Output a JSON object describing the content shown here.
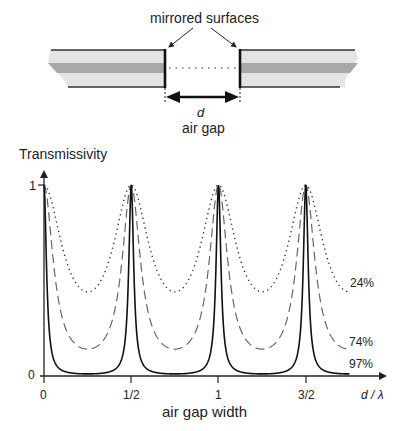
{
  "diagram": {
    "top": {
      "label_mirrors": "mirrored surfaces",
      "label_d": "d",
      "label_gap": "air gap"
    },
    "plot": {
      "ylabel": "Transmissivity",
      "xlabel": "air gap width",
      "x_unit_label": "d / λ",
      "ytick_1": "1",
      "ytick_0": "0",
      "xticks": [
        "0",
        "1/2",
        "1",
        "3/2"
      ],
      "series_labels": [
        "24%",
        "74%",
        "97%"
      ]
    }
  },
  "chart_data": {
    "type": "line",
    "xlabel": "air gap width (d/λ)",
    "ylabel": "Transmissivity",
    "xticks": [
      0,
      0.5,
      1,
      1.5
    ],
    "xtick_labels": [
      "0",
      "1/2",
      "1",
      "3/2"
    ],
    "yticks": [
      0,
      1
    ],
    "xlim": [
      0,
      1.75
    ],
    "ylim": [
      0,
      1
    ],
    "grid": false,
    "peaks_at": [
      0,
      0.5,
      1,
      1.5
    ],
    "series": [
      {
        "name": "24%",
        "style": "dotted",
        "reflectivity": 0.24,
        "peak": 1.0,
        "min": 0.44,
        "finesse_coeff": 1.27
      },
      {
        "name": "74%",
        "style": "dashed",
        "reflectivity": 0.74,
        "peak": 1.0,
        "min": 0.14,
        "finesse_coeff": 6.1
      },
      {
        "name": "97%",
        "style": "solid",
        "reflectivity": 0.97,
        "peak": 1.0,
        "min": 0.01,
        "finesse_coeff": 90
      }
    ]
  }
}
